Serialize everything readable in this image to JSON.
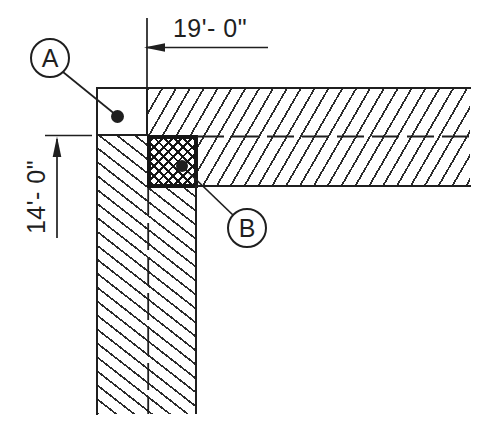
{
  "drawing": {
    "callouts": [
      {
        "label": "A"
      },
      {
        "label": "B"
      }
    ],
    "dimensions": {
      "horizontal": "19'- 0\"",
      "vertical": "14'- 0\""
    },
    "colors": {
      "ink": "#1f1f1f",
      "hatch": "#2b2b2b",
      "column_ink": "#161616",
      "background": "#ffffff"
    }
  }
}
